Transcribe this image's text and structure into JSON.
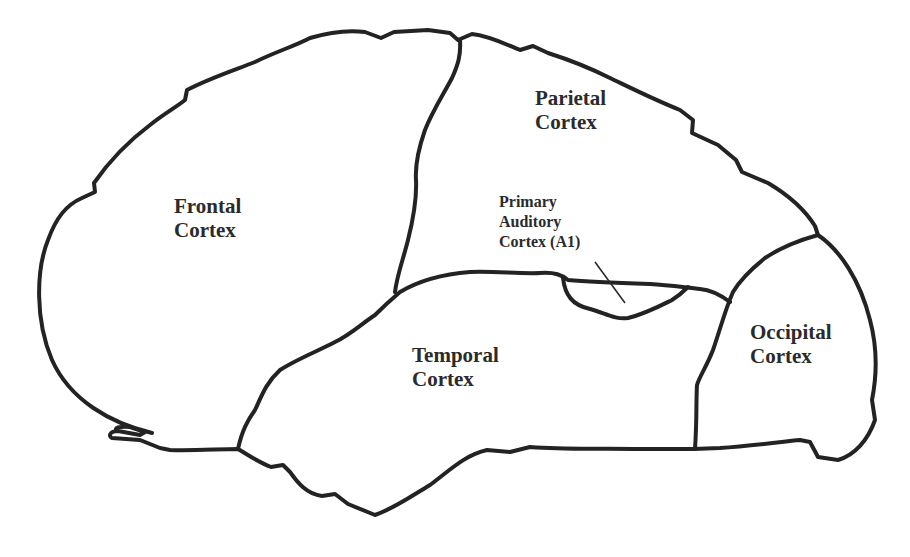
{
  "diagram": {
    "stroke_color": "#232323",
    "label_color": "#2b2b2b",
    "background": "#ffffff",
    "regions": [
      {
        "id": "frontal",
        "lines": [
          "Frontal",
          "Cortex"
        ]
      },
      {
        "id": "parietal",
        "lines": [
          "Parietal",
          "Cortex"
        ]
      },
      {
        "id": "temporal",
        "lines": [
          "Temporal",
          "Cortex"
        ]
      },
      {
        "id": "occipital",
        "lines": [
          "Occipital",
          "Cortex"
        ]
      },
      {
        "id": "primary-auditory",
        "lines": [
          "Primary",
          "Auditory",
          "Cortex (A1)"
        ]
      }
    ]
  }
}
